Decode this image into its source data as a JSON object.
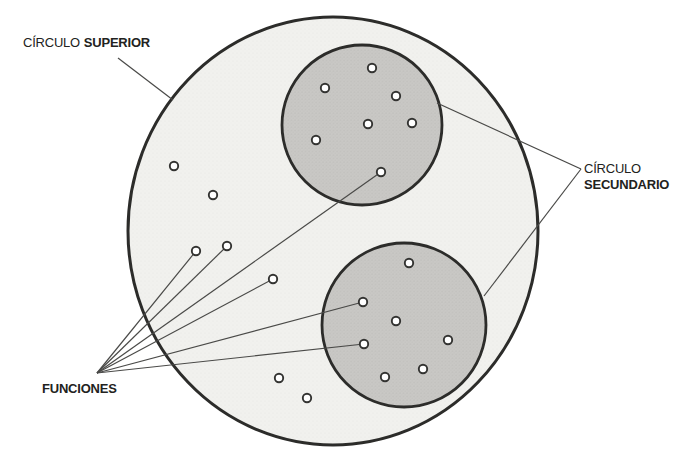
{
  "diagram": {
    "labels": {
      "superior_regular": "CÍRCULO",
      "superior_bold": "SUPERIOR",
      "secundario_line1": "CÍRCULO",
      "secundario_line2": "SECUNDARIO",
      "funciones": "FUNCIONES"
    },
    "colors": {
      "outer_fill": "#f1f1ee",
      "secondary_fill": "#c9c8c5",
      "circle_stroke": "#2c2c2a",
      "leader_line": "#4a4a48",
      "dot_fill": "#ffffff",
      "dot_stroke": "#333331",
      "text": "#222220"
    },
    "outer_circle": {
      "cx": 333,
      "cy": 231,
      "rx": 205,
      "ry": 214
    },
    "secondary_circles": [
      {
        "name": "upper-secondary-circle",
        "cx": 362,
        "cy": 125,
        "r": 80
      },
      {
        "name": "lower-secondary-circle",
        "cx": 404,
        "cy": 325,
        "r": 82
      }
    ],
    "dots": {
      "free": [
        [
          174,
          166
        ],
        [
          213,
          195
        ],
        [
          196,
          251
        ],
        [
          227,
          246
        ],
        [
          273,
          279
        ],
        [
          279,
          378
        ],
        [
          307,
          398
        ]
      ],
      "upper": [
        [
          372,
          68
        ],
        [
          325,
          88
        ],
        [
          396,
          96
        ],
        [
          368,
          124
        ],
        [
          412,
          123
        ],
        [
          316,
          140
        ],
        [
          381,
          172
        ]
      ],
      "lower": [
        [
          409,
          263
        ],
        [
          363,
          302
        ],
        [
          396,
          321
        ],
        [
          448,
          340
        ],
        [
          364,
          344
        ],
        [
          423,
          369
        ],
        [
          385,
          377
        ]
      ]
    },
    "leader_lines": {
      "superior": {
        "from": [
          118,
          58
        ],
        "to": [
          173,
          100
        ]
      },
      "secundario": {
        "origin": [
          581,
          169
        ],
        "targets": [
          [
            437,
            103
          ],
          [
            484,
            296
          ]
        ]
      },
      "funciones": {
        "origin": [
          97,
          373
        ],
        "targets": [
          [
            196,
            251
          ],
          [
            227,
            246
          ],
          [
            273,
            279
          ],
          [
            381,
            172
          ],
          [
            363,
            302
          ],
          [
            364,
            344
          ]
        ]
      }
    },
    "stroke_widths": {
      "outer": 3,
      "secondary": 2.8,
      "leader": 1.2,
      "dot_ring": 1.9
    },
    "dot_radius": 4.2
  }
}
